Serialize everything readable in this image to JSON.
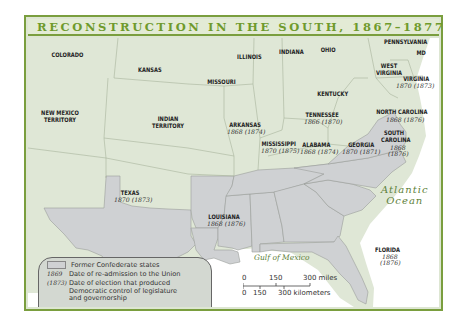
{
  "title": "RECONSTRUCTION IN THE SOUTH, 1867–1877",
  "colors": {
    "frame_green": "#7a9e3e",
    "title_green": "#6f9a2c",
    "land_union": "#dfe7d6",
    "land_confederate": "#cfd1d3",
    "water": "#ffffff",
    "ocean_label": "#5e7f3a"
  },
  "non_confederate_states": [
    {
      "name": "COLORADO"
    },
    {
      "name": "KANSAS"
    },
    {
      "name": "MISSOURI"
    },
    {
      "name": "ILLINOIS"
    },
    {
      "name": "INDIANA"
    },
    {
      "name": "OHIO"
    },
    {
      "name": "PENNSYLVANIA"
    },
    {
      "name": "MD"
    },
    {
      "name": "DE"
    },
    {
      "name": "WEST VIRGINIA"
    },
    {
      "name": "KENTUCKY"
    },
    {
      "name": "NEW MEXICO TERRITORY"
    },
    {
      "name": "INDIAN TERRITORY"
    }
  ],
  "confederate_states": [
    {
      "name": "VIRGINIA",
      "readmitted": "1870",
      "democratic_control": "(1873)"
    },
    {
      "name": "NORTH CAROLINA",
      "readmitted": "1868",
      "democratic_control": "(1876)"
    },
    {
      "name": "SOUTH CAROLINA",
      "readmitted": "1868",
      "democratic_control": "(1876)"
    },
    {
      "name": "TENNESSEE",
      "readmitted": "1866",
      "democratic_control": "(1870)"
    },
    {
      "name": "ARKANSAS",
      "readmitted": "1868",
      "democratic_control": "(1874)"
    },
    {
      "name": "MISSISSIPPI",
      "readmitted": "1870",
      "democratic_control": "(1875)"
    },
    {
      "name": "ALABAMA",
      "readmitted": "1868",
      "democratic_control": "(1874)"
    },
    {
      "name": "GEORGIA",
      "readmitted": "1870",
      "democratic_control": "(1871)"
    },
    {
      "name": "TEXAS",
      "readmitted": "1870",
      "democratic_control": "(1873)"
    },
    {
      "name": "LOUISIANA",
      "readmitted": "1868",
      "democratic_control": "(1876)"
    },
    {
      "name": "FLORIDA",
      "readmitted": "1868",
      "democratic_control": "(1876)"
    }
  ],
  "water_labels": {
    "atlantic_line1": "Atlantic",
    "atlantic_line2": "Ocean",
    "gulf": "Gulf of Mexico"
  },
  "legend": {
    "swatch_label": "Former Confederate states",
    "readmission_key": "1869",
    "readmission_label": "Date of re-admission to the Union",
    "democratic_key": "(1873)",
    "democratic_label_line1": "Date of election that produced",
    "democratic_label_line2": "Democratic control of legislature",
    "democratic_label_line3": "and governorship"
  },
  "scale": {
    "miles_ticks": [
      "0",
      "150",
      "300 miles"
    ],
    "km_ticks": [
      "0",
      "150",
      "300 kilometers"
    ]
  }
}
